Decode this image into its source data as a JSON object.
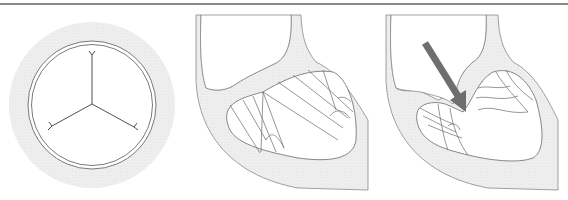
{
  "figure": {
    "panels": [
      {
        "id": "valve-top-view",
        "description": "Tricuspid valve top view (closed leaflets, Y-shaped coaptation lines)"
      },
      {
        "id": "heart-closed-valve",
        "description": "Heart cross-section with closed valve leaflets and chordae"
      },
      {
        "id": "heart-regurgitation",
        "description": "Heart cross-section with open/prolapsing leaflets and flow arrow"
      }
    ],
    "colors": {
      "tissue_fill": "#ececec",
      "outline": "#7a7a7a",
      "arrow": "#6e6e6e",
      "top_rule": "#8a8a8a",
      "background": "#ffffff"
    },
    "arrow": {
      "from": [
        422,
        41
      ],
      "to": [
        466,
        110
      ]
    }
  }
}
